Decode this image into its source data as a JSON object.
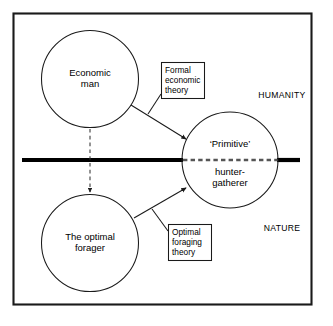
{
  "figure": {
    "title": "",
    "frame": {
      "border_color": "#1a1a1a",
      "background": "#ffffff"
    },
    "colors": {
      "stroke": "#1a1a1a",
      "divider": "#000000",
      "dashed": "#555555",
      "text": "#000000"
    },
    "nodes": [
      {
        "id": "economic-man",
        "label": "Economic\nman",
        "shape": "circle",
        "cx": 90,
        "cy": 79,
        "r": 48.5
      },
      {
        "id": "primitive-hunter-gatherer",
        "label_top": "‘Primitive’",
        "label_bottom": "hunter-\ngatherer",
        "shape": "circle",
        "cx": 230,
        "cy": 160,
        "r": 48
      },
      {
        "id": "the-optimal-forager",
        "label": "The optimal\nforager",
        "shape": "circle",
        "cx": 90,
        "cy": 243,
        "r": 48.5
      }
    ],
    "annotation_boxes": [
      {
        "id": "formal-economic-theory",
        "label": "Formal\neconomic\ntheory",
        "x": 161,
        "y": 62,
        "width": 44,
        "height": 37
      },
      {
        "id": "optimal-foraging-theory",
        "label": "Optimal\nforaging\ntheory",
        "x": 168,
        "y": 224,
        "width": 44,
        "height": 37
      }
    ],
    "domain_labels": [
      {
        "id": "humanity",
        "label": "HUMANITY",
        "x": 256,
        "y": 96
      },
      {
        "id": "nature",
        "label": "NATURE",
        "x": 260,
        "y": 229
      }
    ],
    "connectors": [
      {
        "id": "economic-man-to-hunter-gatherer",
        "type": "solid-arrow",
        "from": "economic-man",
        "to": "primitive-hunter-gatherer"
      },
      {
        "id": "optimal-forager-to-hunter-gatherer",
        "type": "solid-arrow",
        "from": "the-optimal-forager",
        "to": "primitive-hunter-gatherer"
      },
      {
        "id": "economic-man-to-optimal-forager",
        "type": "dashed-arrow",
        "from": "economic-man",
        "to": "the-optimal-forager"
      }
    ],
    "divider": {
      "id": "humanity-nature-divider",
      "type": "horizontal-rule",
      "y": 160,
      "left_segment": [
        22,
        182
      ],
      "dashed_segment": [
        182,
        278
      ],
      "right_segment": [
        278,
        300
      ]
    }
  }
}
